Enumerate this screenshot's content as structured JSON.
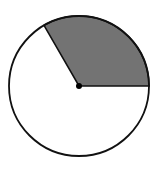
{
  "diagram": {
    "type": "circle-sector",
    "circle": {
      "cx": 79,
      "cy": 86,
      "r": 70,
      "fill": "#ffffff",
      "stroke": "#111111"
    },
    "sector": {
      "start_angle_deg": 0,
      "end_angle_deg": 120,
      "fraction": "1/3",
      "fill": "#737373"
    },
    "center_dot": {
      "r": 3,
      "fill": "#000000"
    }
  }
}
